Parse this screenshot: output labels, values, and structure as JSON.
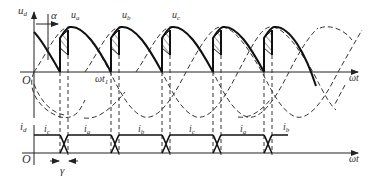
{
  "diagram": {
    "upper_plot": {
      "y_axis_label": "u",
      "y_axis_sub": "d",
      "x_axis_label": "ωt",
      "origin_label": "O",
      "alpha_label": "α",
      "phase_labels": [
        {
          "main": "u",
          "sub": "a"
        },
        {
          "main": "u",
          "sub": "b"
        },
        {
          "main": "u",
          "sub": "c"
        }
      ],
      "time_marker": {
        "main": "ωt",
        "sub": "1"
      }
    },
    "lower_plot": {
      "y_axis_label": "i",
      "y_axis_sub": "d",
      "x_axis_label": "ωt",
      "origin_label": "O",
      "gamma_label": "γ",
      "current_labels": [
        {
          "main": "i",
          "sub": "c"
        },
        {
          "main": "i",
          "sub": "a"
        },
        {
          "main": "i",
          "sub": "b"
        },
        {
          "main": "i",
          "sub": "c"
        },
        {
          "main": "i",
          "sub": "a"
        },
        {
          "main": "i",
          "sub": "b"
        }
      ]
    },
    "colors": {
      "line": "#222222",
      "background": "#ffffff"
    }
  }
}
